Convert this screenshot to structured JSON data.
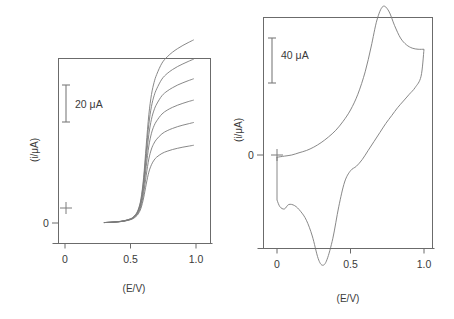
{
  "figure": {
    "background": "#ffffff",
    "curve_color": "#7a7a7a",
    "frame_color": "#6b6b6b",
    "text_color": "#3a3a3a"
  },
  "panels": [
    {
      "id": "left-panel",
      "kind": "hydrodynamic-voltammogram",
      "xlabel": "(E/V)",
      "ylabel": "(i/μA)",
      "zero_label": "0",
      "xticks": [
        "0",
        "0.5",
        "1.0"
      ],
      "scalebar": {
        "label": "20  μA",
        "value": 20,
        "unit": "μA"
      }
    },
    {
      "id": "right-panel",
      "kind": "cyclic-voltammogram",
      "xlabel": "(E/V)",
      "ylabel": "(i/μA)",
      "zero_label": "0",
      "xticks": [
        "0",
        "0.5",
        "1.0"
      ],
      "scalebar": {
        "label": "40  μA",
        "value": 40,
        "unit": "μA"
      }
    }
  ],
  "chart_data": [
    {
      "type": "line",
      "id": "left-panel",
      "title": "",
      "xlabel": "(E/V)",
      "ylabel": "(i/μA)",
      "xlim": [
        -0.08,
        1.08
      ],
      "ylim": [
        -12,
        118
      ],
      "xticks": [
        0,
        0.5,
        1.0
      ],
      "xticklabels": [
        "0",
        "0.5",
        "1.0"
      ],
      "yticks": [
        0
      ],
      "yticklabels": [
        "0"
      ],
      "grid": false,
      "legend": false,
      "scalebar": {
        "value": 20,
        "unit": "μA",
        "label": "20  μA",
        "x": 0.05,
        "y_center": 73
      },
      "annotations": [
        {
          "text": "+",
          "x": 0.0,
          "y": 0.0,
          "name": "origin-plus-marker"
        }
      ],
      "note": "Six sigmoidal steady-state voltammograms of increasing limiting current (rotation-rate / concentration series).",
      "x": [
        0.35,
        0.4,
        0.45,
        0.5,
        0.52,
        0.54,
        0.56,
        0.58,
        0.6,
        0.62,
        0.64,
        0.66,
        0.68,
        0.7,
        0.74,
        0.78,
        0.82,
        0.86,
        0.9,
        0.94,
        0.98
      ],
      "series": [
        {
          "name": "curve-1",
          "limiting_current": 42,
          "values": [
            0.4,
            0.6,
            1.0,
            1.8,
            2.4,
            3.4,
            5.0,
            8.0,
            13.5,
            21.0,
            27.5,
            31.5,
            34.0,
            35.6,
            37.6,
            38.8,
            39.7,
            40.4,
            41.0,
            41.5,
            42.0
          ]
        },
        {
          "name": "curve-2",
          "limiting_current": 55,
          "values": [
            0.4,
            0.6,
            1.0,
            1.9,
            2.6,
            3.7,
            5.6,
            9.2,
            16.0,
            25.8,
            34.6,
            40.0,
            43.2,
            45.3,
            48.2,
            49.9,
            51.1,
            52.1,
            52.9,
            53.6,
            54.3
          ]
        },
        {
          "name": "curve-3",
          "limiting_current": 68,
          "values": [
            0.4,
            0.6,
            1.1,
            2.0,
            2.8,
            4.0,
            6.2,
            10.4,
            18.6,
            30.6,
            41.6,
            48.5,
            52.6,
            55.2,
            58.9,
            61.0,
            62.5,
            63.7,
            64.7,
            65.6,
            66.4
          ]
        },
        {
          "name": "curve-4",
          "limiting_current": 80,
          "values": [
            0.4,
            0.6,
            1.1,
            2.1,
            2.9,
            4.3,
            6.7,
            11.4,
            20.8,
            34.8,
            47.8,
            56.1,
            61.1,
            64.3,
            68.8,
            71.3,
            73.1,
            74.6,
            75.8,
            76.9,
            77.9
          ]
        },
        {
          "name": "curve-5",
          "limiting_current": 92,
          "values": [
            0.4,
            0.7,
            1.2,
            2.2,
            3.1,
            4.5,
            7.1,
            12.3,
            22.7,
            38.6,
            53.4,
            63.0,
            68.8,
            72.5,
            77.8,
            80.8,
            82.9,
            84.6,
            86.0,
            87.3,
            88.5
          ]
        },
        {
          "name": "curve-6",
          "limiting_current": 104,
          "values": [
            0.4,
            0.7,
            1.2,
            2.3,
            3.2,
            4.7,
            7.5,
            13.1,
            24.5,
            42.0,
            58.5,
            69.4,
            76.0,
            80.3,
            86.4,
            89.8,
            92.3,
            94.3,
            96.0,
            97.5,
            98.9
          ]
        }
      ]
    },
    {
      "type": "line",
      "id": "right-panel",
      "title": "",
      "xlabel": "(E/V)",
      "ylabel": "(i/μA)",
      "xlim": [
        -0.1,
        1.1
      ],
      "ylim": [
        -110,
        150
      ],
      "xticks": [
        0,
        0.5,
        1.0
      ],
      "xticklabels": [
        "0",
        "0.5",
        "1.0"
      ],
      "yticks": [
        0
      ],
      "yticklabels": [
        "0"
      ],
      "grid": false,
      "legend": false,
      "scalebar": {
        "value": 40,
        "unit": "μA",
        "label": "40  μA",
        "x": 0.04,
        "y_center": 112
      },
      "annotations": [
        {
          "text": "+",
          "x": 0.0,
          "y": 0.0,
          "name": "origin-plus-marker"
        }
      ],
      "note": "Cyclic voltammogram, closed loop. Forward (anodic) sweep 0 -> 1.0 V with peak near 0.72 V and shoulder near 0.95 V; reverse (cathodic) sweep 1.0 -> 0 V with peak near 0.31 V and second feature near 0.05 V.",
      "forward_sweep": {
        "name": "anodic-forward-scan",
        "direction": "0 V to 1.0 V",
        "peak_potential": 0.72,
        "peak_current": 132,
        "x": [
          0.0,
          0.05,
          0.1,
          0.15,
          0.2,
          0.25,
          0.3,
          0.35,
          0.4,
          0.45,
          0.5,
          0.55,
          0.6,
          0.64,
          0.68,
          0.72,
          0.76,
          0.8,
          0.84,
          0.88,
          0.92,
          0.96,
          1.0
        ],
        "y": [
          -2,
          -1,
          0,
          2,
          4,
          7,
          11,
          16,
          22,
          30,
          40,
          54,
          74,
          96,
          120,
          132,
          128,
          115,
          104,
          98,
          95,
          94,
          94
        ]
      },
      "reverse_sweep": {
        "name": "cathodic-reverse-scan",
        "direction": "1.0 V to 0 V",
        "peak_potential": 0.31,
        "peak_current": -98,
        "secondary_peak_potential": 0.05,
        "secondary_peak_current": -50,
        "x": [
          1.0,
          0.98,
          0.94,
          0.9,
          0.86,
          0.82,
          0.78,
          0.74,
          0.7,
          0.66,
          0.62,
          0.58,
          0.54,
          0.5,
          0.46,
          0.42,
          0.38,
          0.34,
          0.31,
          0.28,
          0.24,
          0.2,
          0.16,
          0.12,
          0.08,
          0.05,
          0.02,
          0.0
        ],
        "y": [
          94,
          70,
          60,
          54,
          48,
          42,
          35,
          28,
          20,
          12,
          4,
          -4,
          -10,
          -14,
          -24,
          -46,
          -74,
          -93,
          -98,
          -92,
          -72,
          -58,
          -50,
          -45,
          -44,
          -48,
          -46,
          -40
        ]
      }
    }
  ]
}
